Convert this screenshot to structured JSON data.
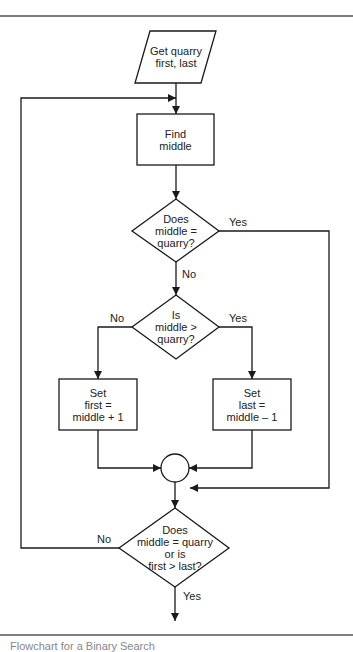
{
  "nodes": {
    "input": {
      "lines": [
        "Get quarry",
        "first, last"
      ]
    },
    "find_middle": {
      "lines": [
        "Find",
        "middle"
      ]
    },
    "decision_equal": {
      "lines": [
        "Does",
        "middle =",
        "quarry?"
      ]
    },
    "decision_greater": {
      "lines": [
        "Is",
        "middle >",
        "quarry?"
      ]
    },
    "set_first": {
      "lines": [
        "Set",
        "first =",
        "middle + 1"
      ]
    },
    "set_last": {
      "lines": [
        "Set",
        "last =",
        "middle – 1"
      ]
    },
    "decision_loop": {
      "lines": [
        "Does",
        "middle = quarry",
        "or is",
        "first > last?"
      ]
    }
  },
  "edge_labels": {
    "equal_yes": "Yes",
    "equal_no": "No",
    "greater_no": "No",
    "greater_yes": "Yes",
    "loop_no": "No",
    "loop_yes": "Yes"
  },
  "caption": "Flowchart for a Binary Search",
  "colors": {
    "line": "#1a1a1a",
    "rule": "#555555",
    "background": "#ffffff"
  }
}
